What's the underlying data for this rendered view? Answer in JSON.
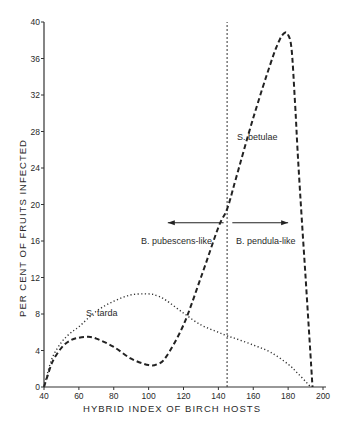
{
  "chart_data": {
    "type": "line",
    "title": "",
    "xlabel": "HYBRID INDEX OF BIRCH HOSTS",
    "ylabel": "PER CENT OF FRUITS INFECTED",
    "xlim": [
      40,
      200
    ],
    "ylim": [
      0,
      40
    ],
    "x_ticks": [
      40,
      60,
      80,
      100,
      120,
      140,
      160,
      180,
      200
    ],
    "y_ticks": [
      0,
      4,
      8,
      12,
      16,
      20,
      24,
      28,
      32,
      36,
      40
    ],
    "grid": false,
    "legend": "none (curves labelled directly)",
    "series": [
      {
        "name": "S. betulae",
        "style": "dashed",
        "x": [
          40,
          42,
          45,
          50,
          55,
          60,
          65,
          70,
          80,
          90,
          100,
          105,
          110,
          120,
          130,
          140,
          145,
          150,
          160,
          170,
          175,
          178,
          180,
          182,
          184,
          186,
          190,
          194
        ],
        "y": [
          0,
          1.2,
          2.8,
          4.3,
          5.1,
          5.4,
          5.5,
          5.3,
          4.4,
          3.1,
          2.4,
          2.5,
          3.3,
          6.8,
          12.0,
          17.5,
          19.5,
          22.8,
          29.5,
          35.5,
          38.0,
          38.8,
          38.6,
          37.0,
          31.0,
          24.0,
          12.0,
          0
        ]
      },
      {
        "name": "S. tarda",
        "style": "dotted",
        "x": [
          40,
          42,
          45,
          50,
          55,
          60,
          70,
          80,
          90,
          100,
          105,
          110,
          120,
          130,
          140,
          145,
          150,
          160,
          170,
          180,
          185,
          190,
          193
        ],
        "y": [
          0,
          1.5,
          3.3,
          4.9,
          5.9,
          6.6,
          8.3,
          9.4,
          10.1,
          10.2,
          10.0,
          9.5,
          8.1,
          6.8,
          6.0,
          5.6,
          5.3,
          4.6,
          3.8,
          2.5,
          1.6,
          0.6,
          0
        ]
      }
    ],
    "annotations": [
      {
        "text": "S. betulae",
        "x": 148,
        "y": 27
      },
      {
        "text": "S. tarda",
        "x": 64,
        "y": 8.2
      },
      {
        "text": "B. pubescens-like",
        "x": 118,
        "y": 16.1,
        "arrow": "left",
        "arrow_from": 143,
        "arrow_to": 111,
        "arrow_y": 18
      },
      {
        "text": "B. pendula-like",
        "x": 146,
        "y": 16.1,
        "arrow": "right",
        "arrow_from": 148,
        "arrow_to": 180,
        "arrow_y": 18
      },
      {
        "text": "vertical reference line",
        "x": 145
      }
    ]
  },
  "labels": {
    "xlabel": "HYBRID INDEX OF BIRCH HOSTS",
    "ylabel": "PER CENT OF FRUITS INFECTED",
    "betulae": "S. betulae",
    "tarda": "S. tarda",
    "pubescens": "B. pubescens-like",
    "pendula": "B. pendula-like"
  }
}
